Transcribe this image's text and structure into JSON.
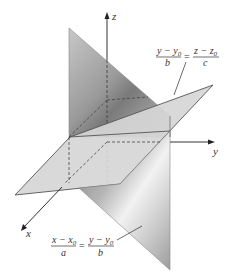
{
  "diagram": {
    "type": "3d-planes-intersection",
    "axes": {
      "x": "x",
      "y": "y",
      "z": "z"
    },
    "equations": [
      {
        "id": "plane-yz",
        "numerator_left": "y − y",
        "numerator_left_sub": "0",
        "denominator_left": "b",
        "equals": "=",
        "numerator_right": "z − z",
        "numerator_right_sub": "0",
        "denominator_right": "c"
      },
      {
        "id": "plane-xy",
        "numerator_left": "x − x",
        "numerator_left_sub": "0",
        "denominator_left": "a",
        "equals": "=",
        "numerator_right": "y − y",
        "numerator_right_sub": "0",
        "denominator_right": "b"
      }
    ],
    "colors": {
      "plane_light": "#d9d9d9",
      "plane_dark": "#8c8c8c",
      "edge": "#555555",
      "axis": "#333333"
    }
  }
}
